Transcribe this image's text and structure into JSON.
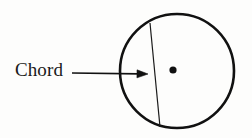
{
  "figure": {
    "kind": "geometry-diagram",
    "topic": "Chord of a circle",
    "background_color": "#fdfdfc",
    "ink_color": "#111111",
    "width": 252,
    "height": 138
  },
  "labels": {
    "chord": "Chord"
  },
  "shapes": {
    "circle": {
      "name": "circle-outline",
      "center_x": 177,
      "center_y": 71,
      "radius": 57,
      "stroke_width": 2.6,
      "stroke_color": "#111111",
      "fill": "none"
    },
    "center_dot": {
      "name": "center-point",
      "cx": 173,
      "cy": 70,
      "r": 3.6,
      "fill": "#111111"
    },
    "chord_line": {
      "name": "chord-segment",
      "x1": 150,
      "y1": 23,
      "x2": 160,
      "y2": 127,
      "stroke_width": 1.2,
      "stroke_color": "#1a1a1a"
    },
    "pointer_arrow": {
      "name": "chord-pointer-arrow",
      "x1": 72,
      "y1": 73,
      "x2": 148,
      "y2": 74,
      "stroke_width": 1.6,
      "stroke_color": "#111111",
      "head_length": 11,
      "head_width": 8
    }
  }
}
